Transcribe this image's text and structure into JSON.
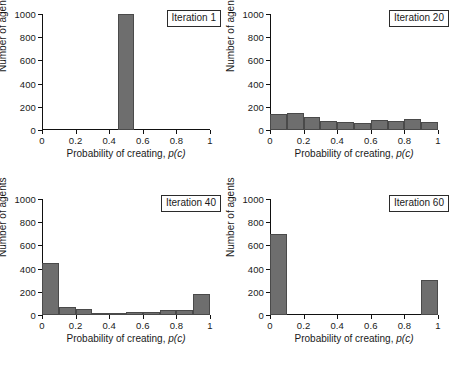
{
  "figure": {
    "panel_count": 4,
    "bar_color": "#6e6e6e",
    "bar_edge_color": "#4a4a4a",
    "axis_color": "#111111",
    "background": "#ffffff"
  },
  "axes_common": {
    "xlabel_prefix": "Probability of creating, ",
    "xlabel_italic": "p(c)",
    "ylabel": "Number of agents",
    "xticks": [
      "0",
      "0.2",
      "0.4",
      "0.6",
      "0.8",
      "1"
    ],
    "xtick_values": [
      0,
      0.2,
      0.4,
      0.6,
      0.8,
      1
    ],
    "yticks": [
      "0",
      "200",
      "400",
      "600",
      "800",
      "1000"
    ],
    "ytick_values": [
      0,
      200,
      400,
      600,
      800,
      1000
    ],
    "xlim": [
      0,
      1
    ],
    "ylim": [
      0,
      1000
    ],
    "grid": false
  },
  "chart_data": [
    {
      "type": "bar",
      "title": "Iteration 1",
      "annotation": "Iteration 1",
      "xlabel": "Probability of creating, p(c)",
      "ylabel": "Number of agents",
      "xlim": [
        0,
        1
      ],
      "ylim": [
        0,
        1000
      ],
      "xticks": [
        0,
        0.2,
        0.4,
        0.6,
        0.8,
        1
      ],
      "yticks": [
        0,
        200,
        400,
        600,
        800,
        1000
      ],
      "grid": false,
      "bin_edges": [
        0.45,
        0.55
      ],
      "bin_centers": [
        0.5
      ],
      "values": [
        1000
      ]
    },
    {
      "type": "bar",
      "title": "Iteration 20",
      "annotation": "Iteration 20",
      "xlabel": "Probability of creating, p(c)",
      "ylabel": "Number of agents",
      "xlim": [
        0,
        1
      ],
      "ylim": [
        0,
        1000
      ],
      "xticks": [
        0,
        0.2,
        0.4,
        0.6,
        0.8,
        1
      ],
      "yticks": [
        0,
        200,
        400,
        600,
        800,
        1000
      ],
      "grid": false,
      "bin_edges": [
        0,
        0.1,
        0.2,
        0.3,
        0.4,
        0.5,
        0.6,
        0.7,
        0.8,
        0.9,
        1.0
      ],
      "bin_centers": [
        0.05,
        0.15,
        0.25,
        0.35,
        0.45,
        0.55,
        0.65,
        0.75,
        0.85,
        0.95
      ],
      "values": [
        140,
        148,
        112,
        78,
        68,
        62,
        86,
        78,
        96,
        72
      ]
    },
    {
      "type": "bar",
      "title": "Iteration 40",
      "annotation": "Iteration 40",
      "xlabel": "Probability of creating, p(c)",
      "ylabel": "Number of agents",
      "xlim": [
        0,
        1
      ],
      "ylim": [
        0,
        1000
      ],
      "xticks": [
        0,
        0.2,
        0.4,
        0.6,
        0.8,
        1
      ],
      "yticks": [
        0,
        200,
        400,
        600,
        800,
        1000
      ],
      "grid": false,
      "bin_edges": [
        0,
        0.1,
        0.2,
        0.3,
        0.4,
        0.5,
        0.6,
        0.7,
        0.8,
        0.9,
        1.0
      ],
      "bin_centers": [
        0.05,
        0.15,
        0.25,
        0.35,
        0.45,
        0.55,
        0.65,
        0.75,
        0.85,
        0.95
      ],
      "values": [
        445,
        66,
        48,
        14,
        18,
        28,
        22,
        44,
        42,
        185
      ]
    },
    {
      "type": "bar",
      "title": "Iteration 60",
      "annotation": "Iteration 60",
      "xlabel": "Probability of creating, p(c)",
      "ylabel": "Number of agents",
      "xlim": [
        0,
        1
      ],
      "ylim": [
        0,
        1000
      ],
      "xticks": [
        0,
        0.2,
        0.4,
        0.6,
        0.8,
        1
      ],
      "yticks": [
        0,
        200,
        400,
        600,
        800,
        1000
      ],
      "grid": false,
      "bin_edges": [
        0,
        0.1,
        0.2,
        0.3,
        0.4,
        0.5,
        0.6,
        0.7,
        0.8,
        0.9,
        1.0
      ],
      "bin_centers": [
        0.05,
        0.15,
        0.25,
        0.35,
        0.45,
        0.55,
        0.65,
        0.75,
        0.85,
        0.95
      ],
      "values": [
        700,
        0,
        0,
        0,
        0,
        0,
        0,
        0,
        0,
        300
      ]
    }
  ]
}
